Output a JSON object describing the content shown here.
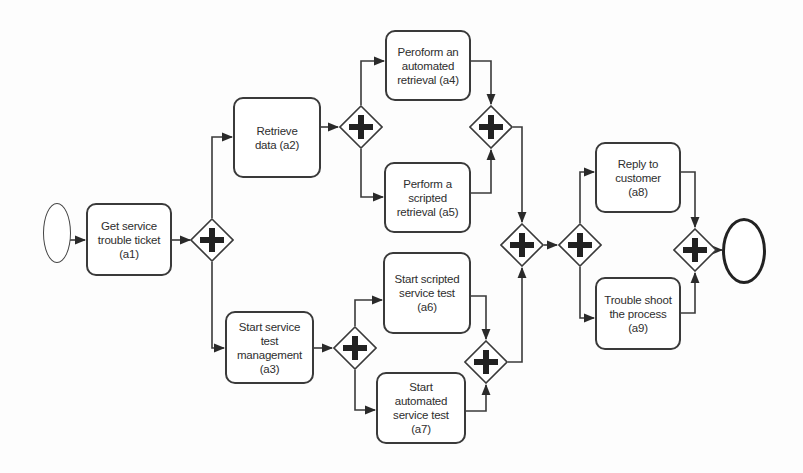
{
  "diagram": {
    "type": "BPMN process",
    "colors": {
      "stroke": "#3a3a3a",
      "fill": "#ffffff",
      "text": "#2e2e2e",
      "background": "#fdfdfd"
    },
    "events": {
      "start": {
        "label": ""
      },
      "end": {
        "label": ""
      }
    },
    "tasks": {
      "a1": {
        "label": "Get service trouble ticket (a1)"
      },
      "a2": {
        "label": "Retrieve data (a2)"
      },
      "a3": {
        "label": "Start service test management (a3)"
      },
      "a4": {
        "label": "Peroform an automated retrieval (a4)"
      },
      "a5": {
        "label": "Perform a scripted retrieval (a5)"
      },
      "a6": {
        "label": "Start scripted service test (a6)"
      },
      "a7": {
        "label": "Start automated service test (a7)"
      },
      "a8": {
        "label": "Reply to customer (a8)"
      },
      "a9": {
        "label": "Trouble shoot the process (a9)"
      }
    },
    "gateways": {
      "g1": {
        "type": "parallel",
        "icon": "plus-icon",
        "role": "split"
      },
      "g2": {
        "type": "parallel",
        "icon": "plus-icon",
        "role": "split"
      },
      "g3": {
        "type": "parallel",
        "icon": "plus-icon",
        "role": "join"
      },
      "g4": {
        "type": "parallel",
        "icon": "plus-icon",
        "role": "split"
      },
      "g5": {
        "type": "parallel",
        "icon": "plus-icon",
        "role": "join"
      },
      "g6": {
        "type": "parallel",
        "icon": "plus-icon",
        "role": "join"
      },
      "g7": {
        "type": "parallel",
        "icon": "plus-icon",
        "role": "split"
      },
      "g8": {
        "type": "parallel",
        "icon": "plus-icon",
        "role": "join"
      }
    },
    "flows": [
      [
        "start",
        "a1"
      ],
      [
        "a1",
        "g1"
      ],
      [
        "g1",
        "a2"
      ],
      [
        "g1",
        "a3"
      ],
      [
        "a2",
        "g2"
      ],
      [
        "g2",
        "a4"
      ],
      [
        "g2",
        "a5"
      ],
      [
        "a4",
        "g3"
      ],
      [
        "a5",
        "g3"
      ],
      [
        "a3",
        "g4"
      ],
      [
        "g4",
        "a6"
      ],
      [
        "g4",
        "a7"
      ],
      [
        "a6",
        "g5"
      ],
      [
        "a7",
        "g5"
      ],
      [
        "g3",
        "g6"
      ],
      [
        "g5",
        "g6"
      ],
      [
        "g6",
        "g7"
      ],
      [
        "g7",
        "a8"
      ],
      [
        "g7",
        "a9"
      ],
      [
        "a8",
        "g8"
      ],
      [
        "a9",
        "g8"
      ],
      [
        "g8",
        "end"
      ]
    ]
  }
}
